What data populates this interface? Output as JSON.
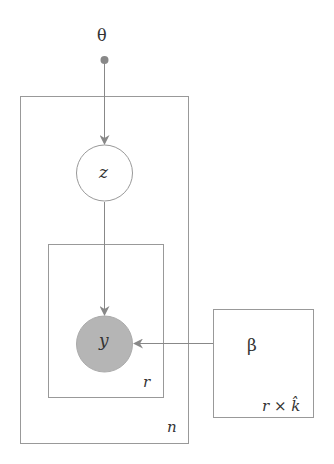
{
  "diagram": {
    "type": "plate-notation",
    "nodes": {
      "theta": {
        "label": "θ",
        "kind": "hyperparameter"
      },
      "z": {
        "label": "z",
        "kind": "latent"
      },
      "y": {
        "label": "y",
        "kind": "observed"
      },
      "beta": {
        "label": "β",
        "kind": "parameter"
      }
    },
    "plates": {
      "outer": {
        "label": "n"
      },
      "inner": {
        "label": "r"
      },
      "beta_plate": {
        "label": "r × k̂"
      }
    },
    "edges": [
      {
        "from": "theta",
        "to": "z"
      },
      {
        "from": "z",
        "to": "y"
      },
      {
        "from": "beta",
        "to": "y"
      }
    ],
    "colors": {
      "line": "#8a8a8a",
      "observed_fill": "#b5b5b5",
      "dot": "#888888"
    }
  }
}
